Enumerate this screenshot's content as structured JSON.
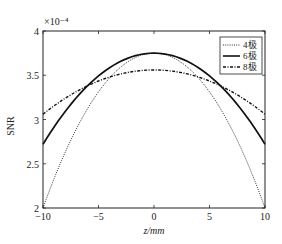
{
  "chart_data": {
    "type": "line",
    "title": "",
    "xlabel": "z/mm",
    "ylabel": "SNR",
    "y_multiplier": "×10⁻⁴",
    "xlim": [
      -10,
      10
    ],
    "ylim": [
      2,
      4
    ],
    "xticks": [
      -10,
      -5,
      0,
      5,
      10
    ],
    "xtick_labels": [
      "−10",
      "−5",
      "0",
      "5",
      "10"
    ],
    "yticks": [
      2,
      2.5,
      3,
      3.5,
      4
    ],
    "ytick_labels": [
      "2",
      "2.5",
      "3",
      "3.5",
      "4"
    ],
    "grid": false,
    "legend_position": "upper right",
    "x": [
      -10,
      -8,
      -6,
      -4,
      -2,
      0,
      2,
      4,
      6,
      8,
      10
    ],
    "series": [
      {
        "name": "4极",
        "style": "dotted",
        "values": [
          2.0,
          2.63,
          3.12,
          3.47,
          3.68,
          3.75,
          3.68,
          3.47,
          3.12,
          2.63,
          2.0
        ]
      },
      {
        "name": "6极",
        "style": "solid",
        "values": [
          2.72,
          3.09,
          3.38,
          3.59,
          3.71,
          3.75,
          3.71,
          3.59,
          3.38,
          3.09,
          2.72
        ]
      },
      {
        "name": "8极",
        "style": "dashdot",
        "values": [
          3.06,
          3.24,
          3.38,
          3.48,
          3.54,
          3.56,
          3.54,
          3.48,
          3.38,
          3.24,
          3.06
        ]
      }
    ]
  },
  "legend": {
    "items": [
      {
        "label": "4极"
      },
      {
        "label": "6极"
      },
      {
        "label": "8极"
      }
    ]
  }
}
